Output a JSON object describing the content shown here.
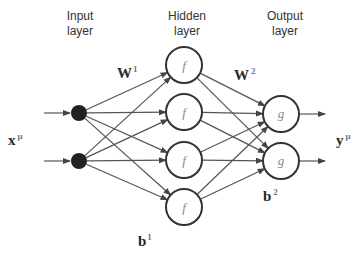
{
  "layers": {
    "input": {
      "title_line1": "Input",
      "title_line2": "layer",
      "node_count": 2
    },
    "hidden": {
      "title_line1": "Hidden",
      "title_line2": "layer",
      "node_count": 4,
      "activation": "f"
    },
    "output": {
      "title_line1": "Output",
      "title_line2": "layer",
      "node_count": 2,
      "activation": "g"
    }
  },
  "labels": {
    "input_vector": {
      "base": "x",
      "sup": "μ"
    },
    "output_vector": {
      "base": "y",
      "sup": "μ"
    },
    "weights1": {
      "base": "W",
      "sup": "1"
    },
    "weights2": {
      "base": "W",
      "sup": "2"
    },
    "bias1": {
      "base": "b",
      "sup": "1"
    },
    "bias2": {
      "base": "b",
      "sup": "2"
    }
  },
  "colors": {
    "line": "#555555",
    "node_stroke": "#333333",
    "input_fill": "#222222"
  }
}
